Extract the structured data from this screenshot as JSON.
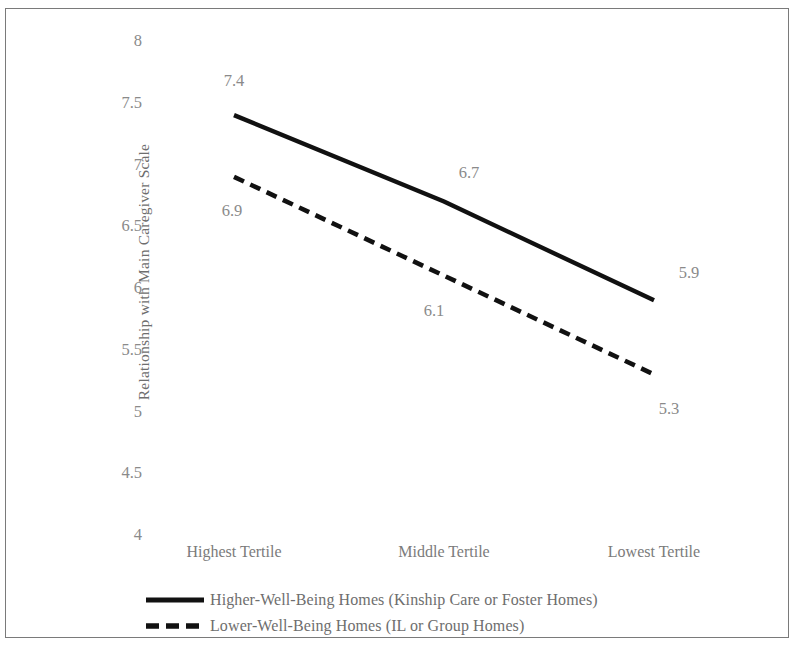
{
  "chart_data": {
    "type": "line",
    "title": "",
    "xlabel": "",
    "ylabel": "Relationship with Main Caregiver Scale",
    "categories": [
      "Highest Tertile",
      "Middle Tertile",
      "Lowest Tertile"
    ],
    "ylim": [
      4,
      8
    ],
    "yticks": [
      "8",
      "7.5",
      "7",
      "6.5",
      "6",
      "5.5",
      "5",
      "4.5",
      "4"
    ],
    "ytick_values": [
      8,
      7.5,
      7,
      6.5,
      6,
      5.5,
      5,
      4.5,
      4
    ],
    "grid": false,
    "legend_position": "bottom-left",
    "series": [
      {
        "name": "Higher-Well-Being Homes (Kinship Care or Foster Homes)",
        "style": "solid",
        "color": "#111111",
        "values": [
          7.4,
          6.7,
          5.9
        ],
        "labels": [
          "7.4",
          "6.7",
          "5.9"
        ]
      },
      {
        "name": "Lower-Well-Being Homes (IL or Group Homes)",
        "style": "dashed",
        "color": "#111111",
        "values": [
          6.9,
          6.1,
          5.3
        ],
        "labels": [
          "6.9",
          "6.1",
          "5.3"
        ]
      }
    ]
  },
  "axis": {
    "y_title": "Relationship with Main Caregiver Scale",
    "y_ticks": [
      {
        "label": "8"
      },
      {
        "label": "7.5"
      },
      {
        "label": "7"
      },
      {
        "label": "6.5"
      },
      {
        "label": "6"
      },
      {
        "label": "5.5"
      },
      {
        "label": "5"
      },
      {
        "label": "4.5"
      },
      {
        "label": "4"
      }
    ],
    "x_ticks": [
      {
        "label": "Highest Tertile"
      },
      {
        "label": "Middle Tertile"
      },
      {
        "label": "Lowest Tertile"
      }
    ]
  },
  "labels": {
    "s1p1": "7.4",
    "s1p2": "6.7",
    "s1p3": "5.9",
    "s2p1": "6.9",
    "s2p2": "6.1",
    "s2p3": "5.3"
  },
  "legend": {
    "entries": [
      {
        "label": "Higher-Well-Being Homes (Kinship Care or Foster Homes)"
      },
      {
        "label": "Lower-Well-Being Homes (IL or Group Homes)"
      }
    ]
  },
  "colors": {
    "line": "#111111",
    "text": "#7b7b7b",
    "frame": "#7a7a7a",
    "background": "#ffffff"
  }
}
